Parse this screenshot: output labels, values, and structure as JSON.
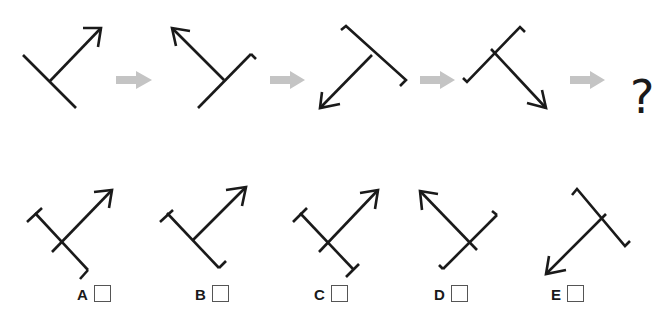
{
  "puzzle": {
    "type": "figure-sequence",
    "sequence_length": 4,
    "unknown_symbol": "?",
    "transition_icon": "gray-right-arrow",
    "colors": {
      "line": "#1a1a1a",
      "transition_arrow": "#c4c4c4",
      "box_border": "#555555"
    }
  },
  "options": [
    {
      "id": "A",
      "label": "A"
    },
    {
      "id": "B",
      "label": "B"
    },
    {
      "id": "C",
      "label": "C"
    },
    {
      "id": "D",
      "label": "D"
    },
    {
      "id": "E",
      "label": "E"
    }
  ]
}
